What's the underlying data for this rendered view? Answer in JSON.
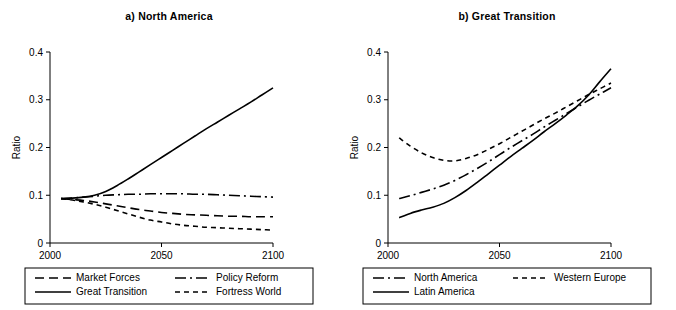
{
  "figure": {
    "width": 676,
    "height": 310,
    "background": "#ffffff",
    "ink": "#000000"
  },
  "panels": [
    {
      "key": "north_america",
      "title": "a) North America",
      "ylabel": "Ratio",
      "y_ticks": [
        "0",
        "0.1",
        "0.2",
        "0.3",
        "0.4"
      ],
      "x_ticks": [
        "2000",
        "2050",
        "2100"
      ],
      "legend": [
        {
          "label": "Market Forces",
          "style": "dashed"
        },
        {
          "label": "Policy Reform",
          "style": "dashdot"
        },
        {
          "label": "Great Transition",
          "style": "solid"
        },
        {
          "label": "Fortress World",
          "style": "dotted"
        }
      ]
    },
    {
      "key": "great_transition",
      "title": "b) Great Transition",
      "ylabel": "Ratio",
      "y_ticks": [
        "0",
        "0.1",
        "0.2",
        "0.3",
        "0.4"
      ],
      "x_ticks": [
        "2000",
        "2050",
        "2100"
      ],
      "legend": [
        {
          "label": "North America",
          "style": "dashdot"
        },
        {
          "label": "Western Europe",
          "style": "dotted"
        },
        {
          "label": "Latin America",
          "style": "solid"
        }
      ]
    }
  ],
  "chart_data": [
    {
      "type": "line",
      "title": "a) North America",
      "xlabel": "",
      "ylabel": "Ratio",
      "xlim": [
        2000,
        2100
      ],
      "ylim": [
        0,
        0.4
      ],
      "xticks": [
        2000,
        2050,
        2100
      ],
      "yticks": [
        0,
        0.1,
        0.2,
        0.3,
        0.4
      ],
      "grid": false,
      "legend_position": "below",
      "x": [
        2005,
        2010,
        2015,
        2020,
        2025,
        2030,
        2035,
        2040,
        2045,
        2050,
        2055,
        2060,
        2065,
        2070,
        2075,
        2080,
        2085,
        2090,
        2095,
        2100
      ],
      "series": [
        {
          "name": "Market Forces",
          "style": "dashed",
          "values": [
            0.093,
            0.091,
            0.089,
            0.086,
            0.082,
            0.078,
            0.074,
            0.07,
            0.067,
            0.064,
            0.062,
            0.06,
            0.059,
            0.058,
            0.057,
            0.056,
            0.056,
            0.055,
            0.055,
            0.055
          ]
        },
        {
          "name": "Policy Reform",
          "style": "dashdot",
          "values": [
            0.093,
            0.094,
            0.096,
            0.098,
            0.1,
            0.101,
            0.102,
            0.102,
            0.103,
            0.103,
            0.103,
            0.103,
            0.102,
            0.102,
            0.101,
            0.1,
            0.099,
            0.098,
            0.097,
            0.096
          ]
        },
        {
          "name": "Great Transition",
          "style": "solid",
          "values": [
            0.093,
            0.094,
            0.096,
            0.1,
            0.108,
            0.12,
            0.134,
            0.149,
            0.164,
            0.179,
            0.194,
            0.209,
            0.224,
            0.239,
            0.253,
            0.267,
            0.281,
            0.295,
            0.31,
            0.325
          ]
        },
        {
          "name": "Fortress World",
          "style": "dotted",
          "values": [
            0.093,
            0.09,
            0.086,
            0.081,
            0.075,
            0.068,
            0.061,
            0.054,
            0.048,
            0.044,
            0.04,
            0.037,
            0.035,
            0.033,
            0.032,
            0.031,
            0.03,
            0.029,
            0.028,
            0.027
          ]
        }
      ]
    },
    {
      "type": "line",
      "title": "b) Great Transition",
      "xlabel": "",
      "ylabel": "Ratio",
      "xlim": [
        2000,
        2100
      ],
      "ylim": [
        0,
        0.4
      ],
      "xticks": [
        2000,
        2050,
        2100
      ],
      "yticks": [
        0,
        0.1,
        0.2,
        0.3,
        0.4
      ],
      "grid": false,
      "legend_position": "below",
      "x": [
        2005,
        2010,
        2015,
        2020,
        2025,
        2030,
        2035,
        2040,
        2045,
        2050,
        2055,
        2060,
        2065,
        2070,
        2075,
        2080,
        2085,
        2090,
        2095,
        2100
      ],
      "series": [
        {
          "name": "North America",
          "style": "dashdot",
          "values": [
            0.093,
            0.099,
            0.106,
            0.113,
            0.121,
            0.131,
            0.143,
            0.156,
            0.17,
            0.185,
            0.2,
            0.214,
            0.228,
            0.243,
            0.257,
            0.271,
            0.285,
            0.299,
            0.312,
            0.325
          ]
        },
        {
          "name": "Western Europe",
          "style": "dotted",
          "values": [
            0.22,
            0.203,
            0.189,
            0.179,
            0.173,
            0.172,
            0.177,
            0.185,
            0.196,
            0.208,
            0.221,
            0.234,
            0.247,
            0.26,
            0.272,
            0.285,
            0.298,
            0.311,
            0.323,
            0.335
          ]
        },
        {
          "name": "Latin America",
          "style": "solid",
          "values": [
            0.053,
            0.062,
            0.069,
            0.075,
            0.083,
            0.095,
            0.11,
            0.127,
            0.145,
            0.163,
            0.181,
            0.198,
            0.215,
            0.233,
            0.25,
            0.268,
            0.287,
            0.31,
            0.338,
            0.365
          ]
        }
      ]
    }
  ]
}
